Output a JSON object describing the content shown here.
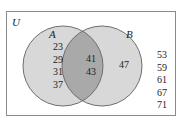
{
  "diagram": {
    "type": "venn",
    "universe_label": "U",
    "set_a_label": "A",
    "set_b_label": "B",
    "only_a": [
      "23",
      "29",
      "31",
      "37"
    ],
    "a_and_b": [
      "41",
      "43"
    ],
    "only_b": [
      "47"
    ],
    "outside": [
      "53",
      "59",
      "61",
      "67",
      "71"
    ],
    "colors": {
      "border": "#8a8a8a",
      "circle_fill": "#d8d8d8",
      "intersection_fill": "#a9a9a9",
      "circle_stroke": "#6e6e6e"
    }
  }
}
